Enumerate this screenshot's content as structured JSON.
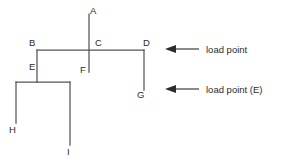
{
  "diagram": {
    "stroke_color": "#555555",
    "text_color": "#2b2b2b",
    "background_color": "#ffffff",
    "nodes": [
      {
        "id": "A",
        "label": "A",
        "label_x": 90,
        "label_y": 14
      },
      {
        "id": "B",
        "label": "B",
        "label_x": 29,
        "label_y": 46
      },
      {
        "id": "C",
        "label": "C",
        "label_x": 95,
        "label_y": 46
      },
      {
        "id": "D",
        "label": "D",
        "label_x": 143,
        "label_y": 46
      },
      {
        "id": "E",
        "label": "E",
        "label_x": 29,
        "label_y": 70
      },
      {
        "id": "F",
        "label": "F",
        "label_x": 80,
        "label_y": 73
      },
      {
        "id": "G",
        "label": "G",
        "label_x": 137,
        "label_y": 98
      },
      {
        "id": "H",
        "label": "H",
        "label_x": 9,
        "label_y": 133
      },
      {
        "id": "I",
        "label": "I",
        "label_x": 67,
        "label_y": 155
      }
    ],
    "edges": [
      {
        "from": "A",
        "to": "F",
        "points": "89,14 89,72"
      },
      {
        "from": "B",
        "to": "D",
        "points": "37,50 144,50"
      },
      {
        "from": "B",
        "to": "E",
        "points": "37,50 37,82"
      },
      {
        "from": "D",
        "to": "G",
        "points": "144,50 144,90"
      },
      {
        "from": "E",
        "to": "I",
        "points": "16,82 70,82"
      },
      {
        "from": "E-left",
        "to": "H",
        "points": "16,82 16,123"
      },
      {
        "from": "E-right",
        "to": "I",
        "points": "70,82 70,145"
      }
    ],
    "annotations": [
      {
        "id": "load-point-c",
        "text": "load point",
        "text_x": 206,
        "text_y": 53,
        "arrow_tip_x": 165,
        "arrow_tail_x": 199,
        "arrow_y": 49
      },
      {
        "id": "load-point-e",
        "text": "load point (E)",
        "text_x": 206,
        "text_y": 93,
        "arrow_tip_x": 165,
        "arrow_tail_x": 199,
        "arrow_y": 89
      }
    ]
  }
}
